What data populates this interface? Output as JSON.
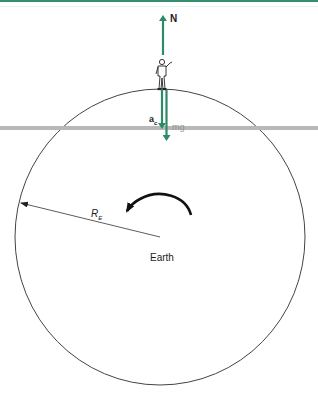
{
  "diagram": {
    "labels": {
      "normal_force": "N",
      "centripetal_accel": "a",
      "centripetal_sub": "c",
      "weight": "mg",
      "radius": "R",
      "radius_sub": "E",
      "body": "Earth"
    },
    "colors": {
      "force_arrow": "#2e8a68",
      "outline": "#333333",
      "band": "#b8b8b8",
      "top_border": "#3a8c70"
    }
  }
}
